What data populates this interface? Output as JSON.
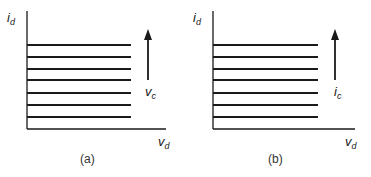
{
  "panels": [
    {
      "id": "a",
      "y_axis_label": "i",
      "y_axis_sub": "d",
      "x_axis_label": "v",
      "x_axis_sub": "d",
      "arrow_label": "v",
      "arrow_sub": "c",
      "caption": "(a)",
      "curve_count": 7
    },
    {
      "id": "b",
      "y_axis_label": "i",
      "y_axis_sub": "d",
      "x_axis_label": "v",
      "x_axis_sub": "d",
      "arrow_label": "i",
      "arrow_sub": "c",
      "caption": "(b)",
      "curve_count": 7
    }
  ],
  "colors": {
    "line": "#1a1a1a",
    "text": "#222222"
  }
}
